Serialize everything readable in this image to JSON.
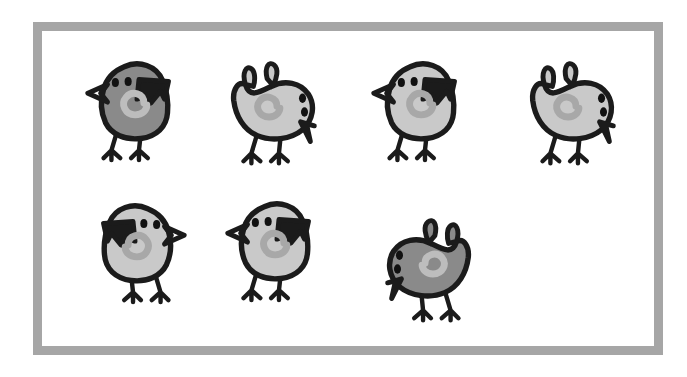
{
  "scene": {
    "title": "Seven cartoon bird drawings inside a gray photo frame",
    "background_color": "#ffffff",
    "frame": {
      "name": "photo-frame",
      "border_color": "#a6a6a6",
      "inner_color": "#ffffff",
      "border_width_px": 9,
      "left": 33,
      "top": 22,
      "width": 630,
      "height": 333
    },
    "palette": {
      "outline": "#1b1b1b",
      "body_dark": "#8a8a8a",
      "body_light": "#c9c9c9",
      "swirl_on_dark": "#bdbdbd",
      "swirl_on_light": "#a8a8a8",
      "eye": "#111111",
      "frame_gray": "#a6a6a6",
      "page_white": "#ffffff"
    },
    "layout": {
      "rows": 2,
      "row1_count": 4,
      "row2_count": 3,
      "total_birds": 7
    }
  },
  "birds": [
    {
      "id": "bird-1",
      "label": "Bird 1",
      "row": 1,
      "index_in_row": 1,
      "pose": "standing",
      "facing": "left",
      "body_tone": "dark",
      "body_color": "#8a8a8a",
      "swirl_color": "#bdbdbd",
      "eyes": 2,
      "left": 78,
      "top": 48,
      "size": 118
    },
    {
      "id": "bird-2",
      "label": "Bird 2",
      "row": 1,
      "index_in_row": 2,
      "pose": "pecking",
      "facing": "right",
      "body_tone": "light",
      "body_color": "#c9c9c9",
      "swirl_color": "#a8a8a8",
      "eyes": 2,
      "left": 216,
      "top": 55,
      "size": 118
    },
    {
      "id": "bird-3",
      "label": "Bird 3",
      "row": 1,
      "index_in_row": 3,
      "pose": "standing",
      "facing": "left",
      "body_tone": "light",
      "body_color": "#c9c9c9",
      "swirl_color": "#a8a8a8",
      "eyes": 2,
      "left": 364,
      "top": 48,
      "size": 118
    },
    {
      "id": "bird-4",
      "label": "Bird 4",
      "row": 1,
      "index_in_row": 4,
      "pose": "pecking",
      "facing": "right",
      "body_tone": "light",
      "body_color": "#c9c9c9",
      "swirl_color": "#a8a8a8",
      "eyes": 2,
      "left": 515,
      "top": 55,
      "size": 118
    },
    {
      "id": "bird-5",
      "label": "Bird 5",
      "row": 2,
      "index_in_row": 1,
      "pose": "standing",
      "facing": "right",
      "body_tone": "light",
      "body_color": "#c9c9c9",
      "swirl_color": "#a8a8a8",
      "eyes": 2,
      "left": 76,
      "top": 190,
      "size": 118
    },
    {
      "id": "bird-6",
      "label": "Bird 6",
      "row": 2,
      "index_in_row": 2,
      "pose": "standing",
      "facing": "left",
      "body_tone": "light",
      "body_color": "#c9c9c9",
      "swirl_color": "#a8a8a8",
      "eyes": 2,
      "left": 218,
      "top": 188,
      "size": 118
    },
    {
      "id": "bird-7",
      "label": "Bird 7",
      "row": 2,
      "index_in_row": 3,
      "pose": "pecking",
      "facing": "left",
      "body_tone": "dark",
      "body_color": "#8a8a8a",
      "swirl_color": "#bdbdbd",
      "eyes": 2,
      "left": 368,
      "top": 212,
      "size": 118
    }
  ]
}
